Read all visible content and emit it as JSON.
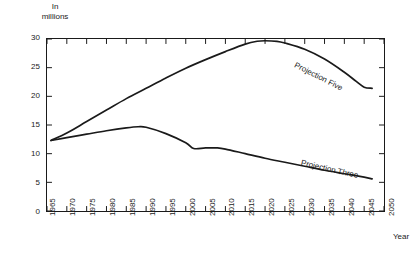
{
  "chart_data": {
    "type": "line",
    "title": "",
    "subtitle": "",
    "unit_caption_line1": "In",
    "unit_caption_line2": "millions",
    "xlabel": "Year",
    "ylabel": "",
    "xlim": [
      1965,
      2050
    ],
    "ylim": [
      0,
      30
    ],
    "grid": false,
    "legend_position": "inline-annotation",
    "xticks": [
      1965,
      1970,
      1975,
      1980,
      1985,
      1990,
      1995,
      2000,
      2005,
      2010,
      2015,
      2020,
      2025,
      2030,
      2035,
      2040,
      2045,
      2050
    ],
    "xtick_labels": [
      "1965",
      "1970",
      "1975",
      "1980",
      "1985",
      "1990",
      "1995",
      "2000",
      "2005",
      "2010",
      "2015",
      "2020",
      "2025",
      "2030",
      "2035",
      "2040",
      "2045",
      "2050"
    ],
    "yticks": [
      0,
      5,
      10,
      15,
      20,
      25,
      30
    ],
    "ytick_labels": [
      "0",
      "5",
      "10",
      "15",
      "20",
      "25",
      "30"
    ],
    "series": [
      {
        "name": "Projection Five",
        "label": "Projection Five",
        "color": "#1a1a1a",
        "x": [
          1966,
          1970,
          1975,
          1980,
          1985,
          1990,
          1995,
          2000,
          2005,
          2010,
          2015,
          2018,
          2020,
          2023,
          2025,
          2030,
          2035,
          2040,
          2043,
          2045,
          2047
        ],
        "values": [
          12.3,
          13.6,
          15.6,
          17.6,
          19.6,
          21.4,
          23.2,
          24.9,
          26.4,
          27.8,
          29.1,
          29.6,
          29.7,
          29.6,
          29.3,
          28.2,
          26.5,
          24.2,
          22.6,
          21.6,
          21.4
        ]
      },
      {
        "name": "Projection Three",
        "label": "Projection Three",
        "color": "#1a1a1a",
        "x": [
          1966,
          1970,
          1975,
          1980,
          1985,
          1988,
          1990,
          1995,
          2000,
          2002,
          2005,
          2008,
          2010,
          2015,
          2020,
          2025,
          2030,
          2035,
          2040,
          2045,
          2047
        ],
        "values": [
          12.3,
          12.8,
          13.4,
          14.0,
          14.5,
          14.7,
          14.6,
          13.5,
          11.9,
          10.9,
          11.0,
          11.0,
          10.8,
          10.0,
          9.2,
          8.5,
          7.8,
          7.1,
          6.5,
          5.9,
          5.6
        ]
      }
    ],
    "annotations": [
      {
        "text": "Projection Five",
        "series": "Projection Five",
        "rotation_deg": 27
      },
      {
        "text": "Projection Three",
        "series": "Projection Three",
        "rotation_deg": 13
      }
    ]
  }
}
